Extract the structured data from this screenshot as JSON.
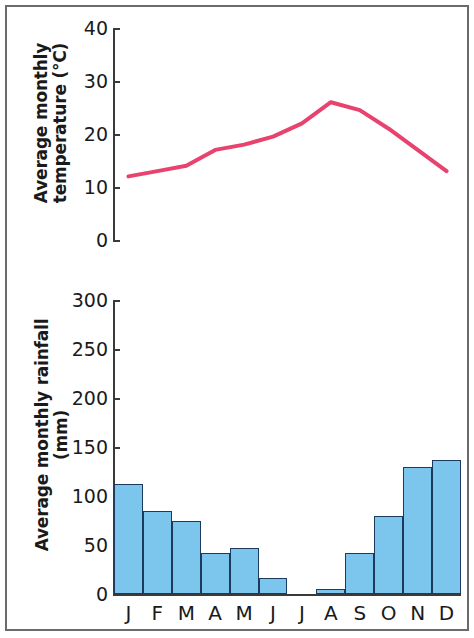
{
  "figure": {
    "width": 474,
    "height": 638,
    "background": "#ffffff",
    "frame_color": "#6b6b6b"
  },
  "chart_data": [
    {
      "type": "line",
      "title": "",
      "xlabel": "",
      "ylabel": "Average monthly temperature (°C)",
      "ylabel_lines": [
        "Average monthly",
        "temperature (°C)"
      ],
      "categories": [
        "J",
        "F",
        "M",
        "A",
        "M",
        "J",
        "J",
        "A",
        "S",
        "O",
        "N",
        "D"
      ],
      "x": [
        "J",
        "F",
        "M",
        "A",
        "M",
        "J",
        "J",
        "A",
        "S",
        "O",
        "N",
        "D"
      ],
      "values": [
        12,
        13,
        14,
        17,
        18,
        19.5,
        22,
        26,
        24.5,
        21,
        17,
        13
      ],
      "ylim": [
        0,
        40
      ],
      "yticks": [
        0,
        10,
        20,
        30,
        40
      ],
      "ytick_labels": [
        "0",
        "10",
        "20",
        "30",
        "40"
      ],
      "grid": false,
      "legend": "none",
      "line_color": "#e8436f",
      "line_width": 4,
      "units": "°C"
    },
    {
      "type": "bar",
      "title": "",
      "xlabel": "",
      "ylabel": "Average monthly rainfall (mm)",
      "ylabel_lines": [
        "Average monthly rainfall",
        "(mm)"
      ],
      "categories": [
        "J",
        "F",
        "M",
        "A",
        "M",
        "J",
        "J",
        "A",
        "S",
        "O",
        "N",
        "D"
      ],
      "values": [
        112,
        85,
        75,
        42,
        47,
        16,
        0,
        5,
        42,
        80,
        130,
        137
      ],
      "ylim": [
        0,
        300
      ],
      "yticks": [
        0,
        50,
        100,
        150,
        200,
        250,
        300
      ],
      "ytick_labels": [
        "0",
        "50",
        "100",
        "150",
        "200",
        "250",
        "300"
      ],
      "grid": false,
      "legend": "none",
      "bar_color": "#7cc6ee",
      "bar_edge_color": "#1b3a5c",
      "units": "mm"
    }
  ],
  "temperature_panel": {
    "ytick_labels": [
      "40",
      "30",
      "20",
      "10",
      "0"
    ],
    "axis_title_line1": "Average monthly",
    "axis_title_line2": "temperature (°C)"
  },
  "rainfall_panel": {
    "ytick_labels": [
      "300",
      "250",
      "200",
      "150",
      "100",
      "50",
      "0"
    ],
    "axis_title_line1": "Average monthly rainfall",
    "axis_title_line2": "(mm)",
    "month_labels": [
      "J",
      "F",
      "M",
      "A",
      "M",
      "J",
      "J",
      "A",
      "S",
      "O",
      "N",
      "D"
    ]
  }
}
